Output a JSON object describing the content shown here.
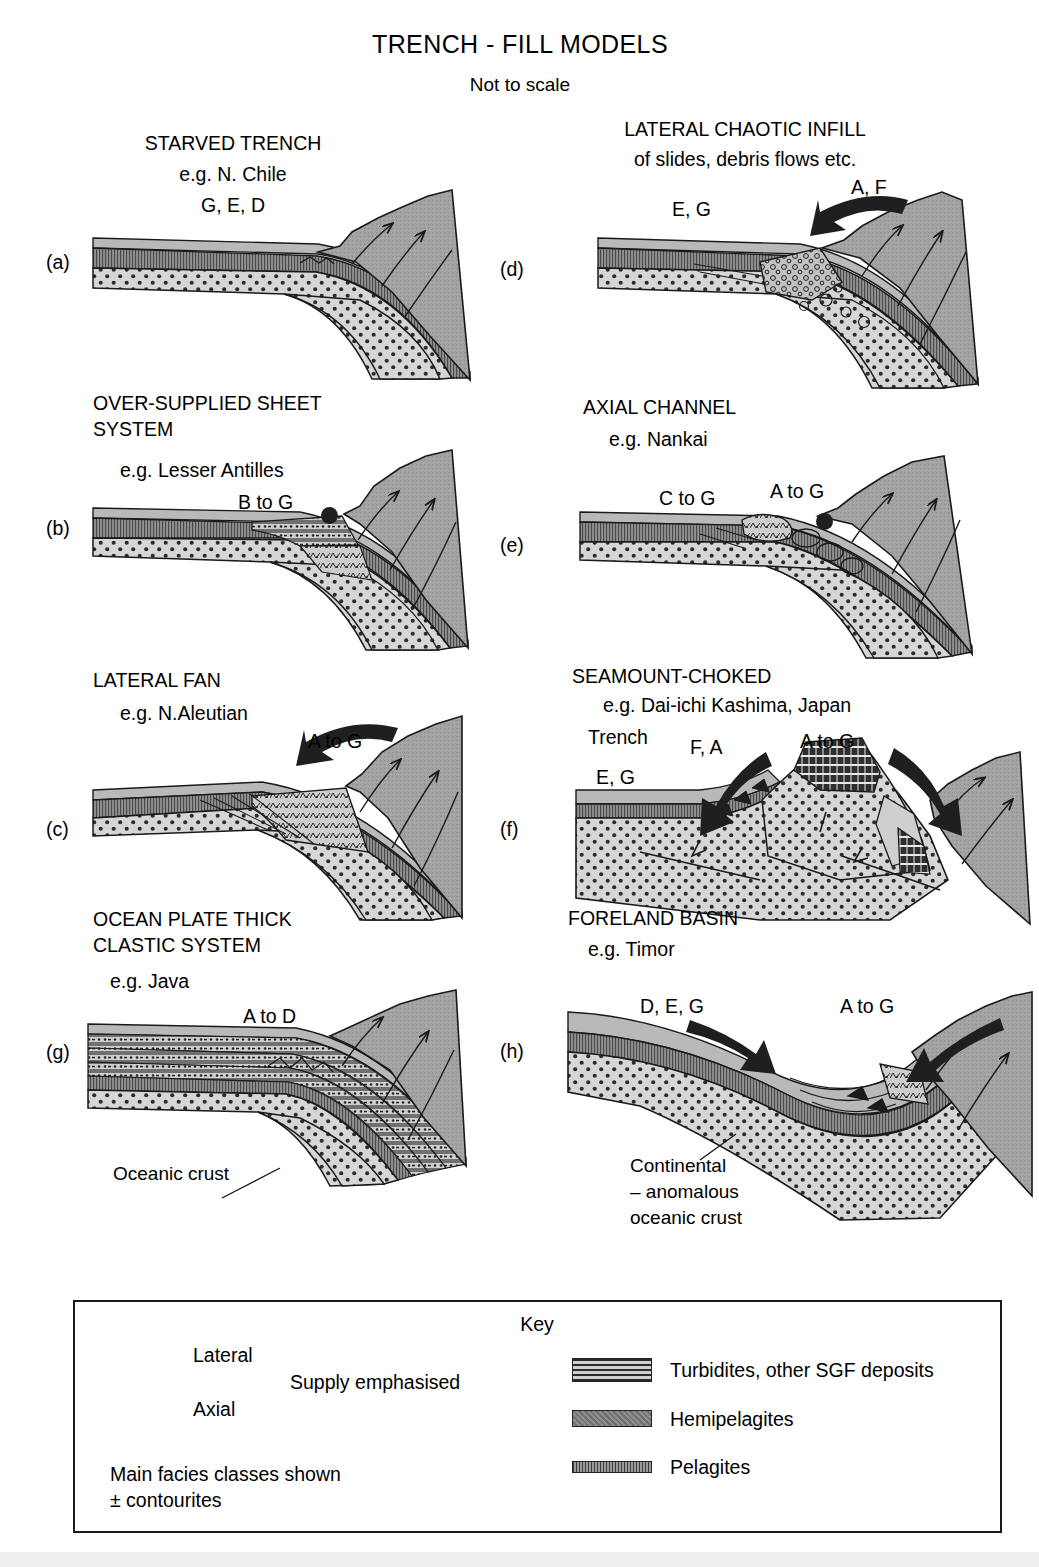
{
  "figure": {
    "title": "TRENCH - FILL MODELS",
    "subtitle": "Not to scale"
  },
  "panels": [
    {
      "id": "a",
      "label": "(a)",
      "heading": "STARVED TRENCH",
      "example": "e.g. N. Chile",
      "facies": [
        "G, E, D"
      ],
      "supply": []
    },
    {
      "id": "b",
      "label": "(b)",
      "heading": "OVER-SUPPLIED SHEET",
      "heading2": "SYSTEM",
      "example": "e.g. Lesser Antilles",
      "facies": [
        "B to G"
      ],
      "supply": [
        "axial"
      ]
    },
    {
      "id": "c",
      "label": "(c)",
      "heading": "LATERAL FAN",
      "example": "e.g. N.Aleutian",
      "facies": [
        "A to G"
      ],
      "supply": [
        "lateral"
      ]
    },
    {
      "id": "g",
      "label": "(g)",
      "heading": "OCEAN PLATE THICK",
      "heading2": "CLASTIC SYSTEM",
      "example": "e.g. Java",
      "facies": [
        "A to D"
      ],
      "supply": []
    },
    {
      "id": "d",
      "label": "(d)",
      "heading": "LATERAL CHAOTIC INFILL",
      "heading2": "of slides, debris flows etc.",
      "facies": [
        "E, G",
        "A, F"
      ],
      "supply": [
        "lateral"
      ]
    },
    {
      "id": "e",
      "label": "(e)",
      "heading": "AXIAL CHANNEL",
      "example": "e.g. Nankai",
      "facies": [
        "C to G",
        "A to G"
      ],
      "supply": [
        "axial"
      ]
    },
    {
      "id": "f",
      "label": "(f)",
      "heading": "SEAMOUNT-CHOKED",
      "example": "e.g. Dai-ichi Kashima, Japan",
      "example2": "Trench",
      "facies": [
        "F, A",
        "A to G",
        "E, G"
      ],
      "supply": [
        "lateral",
        "lateral"
      ]
    },
    {
      "id": "h",
      "label": "(h)",
      "heading": "FORELAND BASIN",
      "example": "e.g. Timor",
      "facies": [
        "D, E, G",
        "A to G"
      ],
      "supply": [
        "lateral",
        "lateral"
      ]
    }
  ],
  "annotations": {
    "oceanic_crust": "Oceanic crust",
    "continental_line1": "Continental",
    "continental_line2": "– anomalous",
    "continental_line3": "oceanic crust"
  },
  "key": {
    "title": "Key",
    "supply": {
      "lateral_label": "Lateral",
      "axial_label": "Axial",
      "brace_label": "Supply emphasised"
    },
    "note_line1": "Main facies classes shown",
    "note_line2": "± contourites",
    "legend_items": [
      {
        "pattern": "turbidites",
        "label": "Turbidites, other SGF deposits"
      },
      {
        "pattern": "hemipelagites",
        "label": "Hemipelagites"
      },
      {
        "pattern": "pelagites",
        "label": "Pelagites"
      }
    ]
  },
  "colors": {
    "wedge_grey": "#9b9b9b",
    "crust_grey": "#d4d4d4",
    "hemipelagite_grey": "#8e8e8e",
    "pelagite_grey": "#7d7d7d",
    "turbidite_grey": "#c9c9c9",
    "line": "#1a1a1a",
    "background": "#ffffff"
  }
}
